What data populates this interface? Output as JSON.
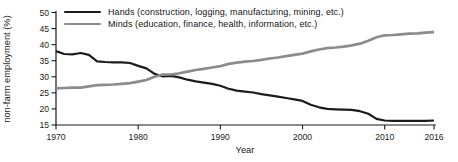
{
  "chart_data": {
    "type": "line",
    "title": "",
    "xlabel": "Year",
    "ylabel": "non-farm employment (%)",
    "xlim": [
      1970,
      2016
    ],
    "ylim": [
      15,
      50
    ],
    "xticks": [
      1970,
      1980,
      1990,
      2000,
      2010,
      2016
    ],
    "yticks": [
      15,
      20,
      25,
      30,
      35,
      40,
      45,
      50
    ],
    "grid": false,
    "legend_position": "top-left-inside",
    "x": [
      1970,
      1971,
      1972,
      1973,
      1974,
      1975,
      1976,
      1977,
      1978,
      1979,
      1980,
      1981,
      1982,
      1983,
      1984,
      1985,
      1986,
      1987,
      1988,
      1989,
      1990,
      1991,
      1992,
      1993,
      1994,
      1995,
      1996,
      1997,
      1998,
      1999,
      2000,
      2001,
      2002,
      2003,
      2004,
      2005,
      2006,
      2007,
      2008,
      2009,
      2010,
      2011,
      2012,
      2013,
      2014,
      2015,
      2016
    ],
    "series": [
      {
        "name": "Hands",
        "legend_label": "Hands (construction, logging, manufacturing, mining, etc.)",
        "color": "#1c1c1c",
        "line_width": 2.2,
        "values": [
          38.0,
          37.1,
          37.0,
          37.4,
          36.8,
          34.8,
          34.6,
          34.5,
          34.5,
          34.3,
          33.4,
          32.6,
          30.9,
          30.1,
          30.3,
          29.8,
          29.1,
          28.6,
          28.2,
          27.8,
          27.2,
          26.3,
          25.7,
          25.4,
          25.1,
          24.6,
          24.2,
          23.8,
          23.4,
          23.0,
          22.5,
          21.3,
          20.5,
          20.0,
          19.9,
          19.8,
          19.7,
          19.3,
          18.5,
          16.9,
          16.4,
          16.3,
          16.3,
          16.3,
          16.3,
          16.3,
          16.4
        ]
      },
      {
        "name": "Minds",
        "legend_label": "Minds (education, finance, health, information, etc.)",
        "color": "#8c8c8c",
        "line_width": 2.7,
        "values": [
          26.4,
          26.5,
          26.6,
          26.6,
          27.0,
          27.4,
          27.5,
          27.6,
          27.8,
          28.0,
          28.5,
          29.0,
          30.0,
          30.7,
          30.7,
          31.1,
          31.6,
          32.1,
          32.5,
          32.9,
          33.3,
          34.0,
          34.4,
          34.7,
          34.9,
          35.3,
          35.7,
          36.0,
          36.4,
          36.8,
          37.2,
          37.9,
          38.5,
          38.9,
          39.1,
          39.4,
          39.8,
          40.3,
          41.2,
          42.3,
          42.9,
          43.0,
          43.2,
          43.4,
          43.5,
          43.7,
          43.9
        ]
      }
    ],
    "annotations": {
      "crossover_year": 1982,
      "crossover_value": 30.4
    },
    "axis_color": "#1a1a1a"
  }
}
